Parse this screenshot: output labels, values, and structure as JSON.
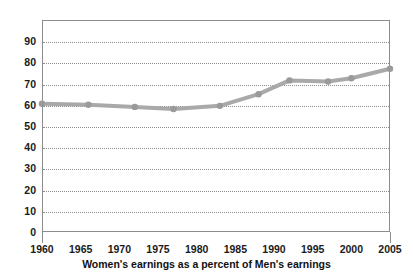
{
  "chart_data": {
    "type": "line",
    "title": "",
    "subtitle": "",
    "caption": "Women's earnings as a percent of Men's earnings",
    "xlabel": "",
    "ylabel": "",
    "xlim": [
      1960,
      2005
    ],
    "ylim": [
      0,
      100
    ],
    "grid": true,
    "legend": null,
    "legend_position": "none",
    "y_ticks": [
      0,
      10,
      20,
      30,
      40,
      50,
      60,
      70,
      80,
      90
    ],
    "y_tick_labels": [
      "0",
      "10",
      "20",
      "30",
      "40",
      "50",
      "60",
      "70",
      "80",
      "90"
    ],
    "x_ticks": [
      1960,
      1965,
      1970,
      1975,
      1980,
      1985,
      1990,
      1995,
      2000,
      2005
    ],
    "x_tick_labels": [
      "1960",
      "1965",
      "1970",
      "1975",
      "1980",
      "1985",
      "1990",
      "1995",
      "2000",
      "2005"
    ],
    "series": [
      {
        "name": "Women's earnings as a percent of Men's earnings",
        "color": "#a9a9a9",
        "marker": "circle",
        "x": [
          1960,
          1966,
          1972,
          1977,
          1983,
          1988,
          1992,
          1997,
          2000,
          2005
        ],
        "values": [
          60.5,
          60.0,
          59.0,
          58.0,
          59.5,
          65.0,
          71.5,
          71.0,
          72.5,
          77.0
        ]
      }
    ]
  },
  "axis": {
    "y_labels": [
      {
        "value": 90,
        "text": "90"
      },
      {
        "value": 80,
        "text": "80"
      },
      {
        "value": 70,
        "text": "70"
      },
      {
        "value": 60,
        "text": "60"
      },
      {
        "value": 50,
        "text": "50"
      },
      {
        "value": 40,
        "text": "40"
      },
      {
        "value": 30,
        "text": "30"
      },
      {
        "value": 20,
        "text": "20"
      },
      {
        "value": 10,
        "text": "10"
      },
      {
        "value": 0,
        "text": "0"
      }
    ],
    "x_labels": [
      {
        "value": 1960,
        "text": "1960"
      },
      {
        "value": 1965,
        "text": "1965"
      },
      {
        "value": 1970,
        "text": "1970"
      },
      {
        "value": 1975,
        "text": "1975"
      },
      {
        "value": 1980,
        "text": "1980"
      },
      {
        "value": 1985,
        "text": "1985"
      },
      {
        "value": 1990,
        "text": "1990"
      },
      {
        "value": 1995,
        "text": "1995"
      },
      {
        "value": 2000,
        "text": "2000"
      },
      {
        "value": 2005,
        "text": "2005"
      }
    ]
  },
  "colors": {
    "series_line": "#a9a9a9",
    "series_marker": "#9a9a9a",
    "gridline": "#8d8d8d",
    "frame": "#8c8c8c",
    "text": "#1a1a1a",
    "background": "#ffffff"
  },
  "caption": {
    "text": "Women's earnings as a percent of Men's earnings"
  }
}
